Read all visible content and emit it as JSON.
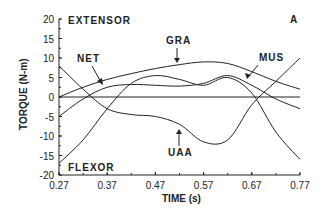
{
  "chart_data": {
    "type": "line",
    "panel_label": "A",
    "title": "",
    "xlabel": "TIME (s)",
    "ylabel": "TORQUE (N-m)",
    "xlim": [
      0.27,
      0.77
    ],
    "ylim": [
      -20,
      20
    ],
    "xticks": [
      "0.27",
      "0.37",
      "0.47",
      "0.57",
      "0.67",
      "0.77"
    ],
    "yticks": [
      "20",
      "15",
      "10",
      "5",
      "0",
      "-5",
      "-10",
      "-15",
      "-20"
    ],
    "grid": false,
    "legend_position": "inline annotations",
    "annotations": {
      "top": "EXTENSOR",
      "bottom": "FLEXOR"
    },
    "x": [
      0.27,
      0.32,
      0.37,
      0.42,
      0.47,
      0.52,
      0.57,
      0.62,
      0.67,
      0.72,
      0.77
    ],
    "series": [
      {
        "name": "GRA",
        "values": [
          0,
          2.5,
          4.5,
          6.0,
          7.3,
          8.3,
          9.0,
          8.6,
          6.5,
          4.0,
          2.0
        ]
      },
      {
        "name": "NET",
        "values": [
          -5,
          -0.5,
          2.5,
          3.2,
          3.0,
          2.8,
          3.5,
          5.5,
          3.0,
          -0.5,
          -3.0
        ]
      },
      {
        "name": "MUS",
        "values": [
          -17,
          -11,
          -3,
          3.5,
          5.5,
          4.5,
          3.0,
          5.0,
          1.0,
          -9.0,
          -16.0
        ]
      },
      {
        "name": "UAA",
        "values": [
          8,
          2,
          -3.0,
          -4.5,
          -5.0,
          -7.0,
          -11.5,
          -11.0,
          -2.0,
          4.0,
          10.0
        ]
      }
    ],
    "labels": {
      "GRA": "GRA",
      "NET": "NET",
      "MUS": "MUS",
      "UAA": "UAA"
    }
  }
}
